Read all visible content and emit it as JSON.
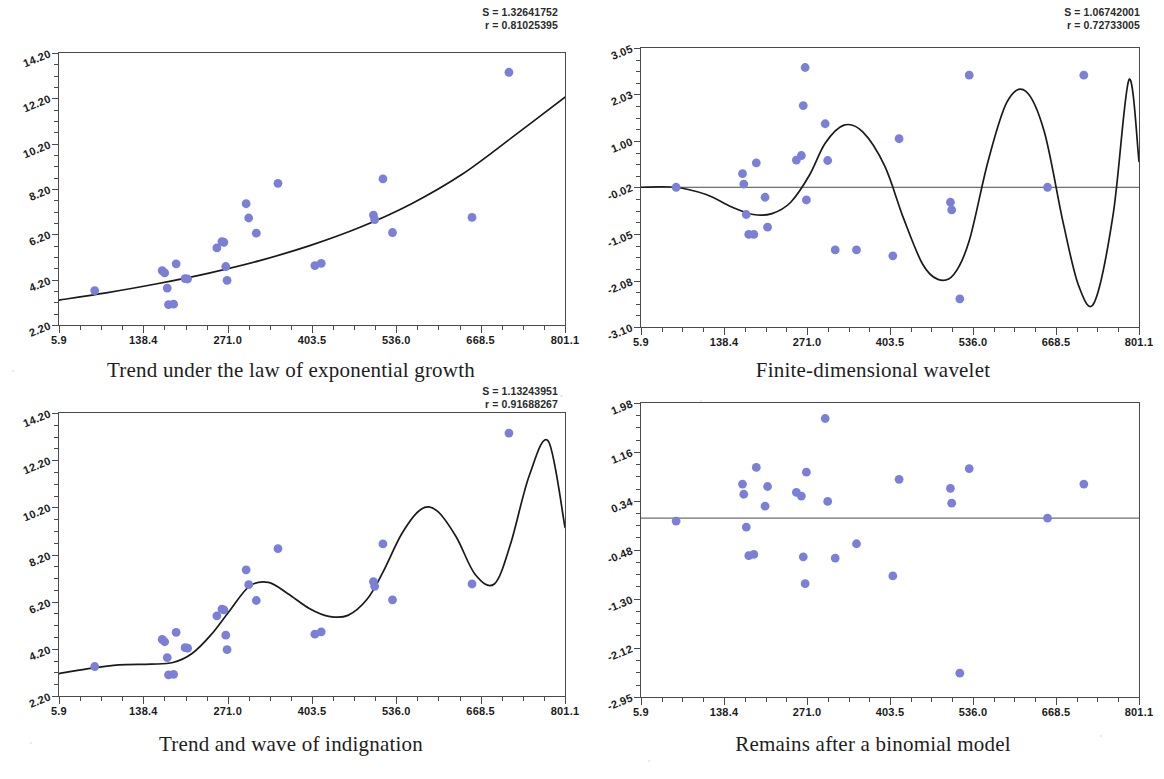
{
  "figure": {
    "marker_color": "#7b7fd8",
    "line_color": "#1a1a1a",
    "axis_color": "#4a4a4a",
    "background": "#ffffff"
  },
  "panels": [
    {
      "id": "top-left",
      "caption": "Trend under the law of exponential growth",
      "stats": {
        "s_label": "S = 1.32641752",
        "r_label": "r = 0.81025395"
      },
      "chart_data": {
        "type": "scatter",
        "title": "Trend under the law of exponential growth",
        "xlabel": "",
        "ylabel": "",
        "grid": false,
        "legend": "none",
        "xlim": [
          5.9,
          801.1
        ],
        "ylim": [
          2.2,
          14.2
        ],
        "xticks": [
          "5.9",
          "138.4",
          "271.0",
          "403.5",
          "536.0",
          "668.5",
          "801.1"
        ],
        "xtick_values": [
          5.9,
          138.4,
          271.0,
          403.5,
          536.0,
          668.5,
          801.1
        ],
        "yticks": [
          "14.20",
          "12.20",
          "10.20",
          "8.20",
          "6.20",
          "4.20",
          "2.20"
        ],
        "ytick_values": [
          14.2,
          12.2,
          10.2,
          8.2,
          6.2,
          4.2,
          2.2
        ],
        "points": [
          [
            62,
            3.72
          ],
          [
            168,
            4.6
          ],
          [
            172,
            4.5
          ],
          [
            176,
            3.83
          ],
          [
            178,
            3.1
          ],
          [
            186,
            3.12
          ],
          [
            190,
            4.9
          ],
          [
            204,
            4.25
          ],
          [
            208,
            4.23
          ],
          [
            254,
            5.6
          ],
          [
            262,
            5.88
          ],
          [
            265,
            5.85
          ],
          [
            268,
            4.78
          ],
          [
            270,
            4.17
          ],
          [
            300,
            7.55
          ],
          [
            304,
            6.92
          ],
          [
            316,
            6.25
          ],
          [
            350,
            8.45
          ],
          [
            408,
            4.82
          ],
          [
            418,
            4.92
          ],
          [
            500,
            7.05
          ],
          [
            502,
            6.85
          ],
          [
            515,
            8.65
          ],
          [
            530,
            6.28
          ],
          [
            655,
            6.95
          ],
          [
            713,
            13.35
          ]
        ],
        "series": [
          {
            "name": "exponential trend",
            "type": "line",
            "model": "exponential growth",
            "x": [
              5.9,
              80,
              160,
              240,
              320,
              400,
              480,
              560,
              640,
              720,
              801.1
            ],
            "y": [
              3.3,
              3.62,
              4.02,
              4.48,
              5.03,
              5.7,
              6.52,
              7.55,
              8.86,
              10.52,
              12.25
            ]
          }
        ]
      }
    },
    {
      "id": "top-right",
      "caption": "Finite-dimensional wavelet",
      "stats": {
        "s_label": "S = 1.06742001",
        "r_label": "r = 0.72733005"
      },
      "chart_data": {
        "type": "scatter",
        "title": "Finite-dimensional wavelet",
        "xlabel": "",
        "ylabel": "",
        "grid": false,
        "legend": "none",
        "xlim": [
          5.9,
          801.1
        ],
        "ylim": [
          -3.1,
          3.05
        ],
        "xticks": [
          "5.9",
          "138.4",
          "271.0",
          "403.5",
          "536.0",
          "668.5",
          "801.1"
        ],
        "xtick_values": [
          5.9,
          138.4,
          271.0,
          403.5,
          536.0,
          668.5,
          801.1
        ],
        "yticks": [
          "3.05",
          "2.03",
          "1.00",
          "-0.02",
          "-1.05",
          "-2.08",
          "-3.10"
        ],
        "ytick_values": [
          3.05,
          2.03,
          1.0,
          -0.02,
          -1.05,
          -2.08,
          -3.1
        ],
        "points": [
          [
            62,
            -0.02
          ],
          [
            168,
            0.28
          ],
          [
            170,
            0.05
          ],
          [
            174,
            -0.62
          ],
          [
            178,
            -1.06
          ],
          [
            186,
            -1.06
          ],
          [
            190,
            0.52
          ],
          [
            204,
            -0.24
          ],
          [
            208,
            -0.9
          ],
          [
            254,
            0.58
          ],
          [
            262,
            0.68
          ],
          [
            265,
            1.78
          ],
          [
            268,
            2.62
          ],
          [
            270,
            -0.3
          ],
          [
            300,
            1.38
          ],
          [
            304,
            0.57
          ],
          [
            316,
            -1.4
          ],
          [
            350,
            -1.4
          ],
          [
            408,
            -1.53
          ],
          [
            418,
            1.05
          ],
          [
            500,
            -0.35
          ],
          [
            502,
            -0.52
          ],
          [
            515,
            -2.48
          ],
          [
            530,
            2.45
          ],
          [
            655,
            -0.02
          ],
          [
            713,
            2.45
          ]
        ],
        "series": [
          {
            "name": "wavelet fit",
            "type": "line",
            "model": "finite-dimensional wavelet",
            "x": [
              5.9,
              60,
              110,
              150,
              185,
              215,
              245,
              275,
              300,
              330,
              360,
              395,
              425,
              455,
              480,
              505,
              530,
              560,
              590,
              620,
              650,
              680,
              705,
              730,
              760,
              785,
              801.1
            ],
            "y": [
              -0.02,
              -0.02,
              -0.18,
              -0.45,
              -0.62,
              -0.6,
              -0.35,
              0.25,
              0.95,
              1.35,
              1.2,
              0.45,
              -0.7,
              -1.7,
              -2.05,
              -1.95,
              -1.2,
              0.55,
              1.85,
              2.1,
              1.2,
              -0.8,
              -2.2,
              -2.55,
              -0.6,
              2.35,
              0.55
            ]
          }
        ]
      }
    },
    {
      "id": "bottom-left",
      "caption": "Trend and wave of indignation",
      "stats": {
        "s_label": "S = 1.13243951",
        "r_label": "r = 0.91688267"
      },
      "chart_data": {
        "type": "scatter",
        "title": "Trend and wave of indignation",
        "xlabel": "",
        "ylabel": "",
        "grid": false,
        "legend": "none",
        "xlim": [
          5.9,
          801.1
        ],
        "ylim": [
          2.2,
          14.2
        ],
        "xticks": [
          "5.9",
          "138.4",
          "271.0",
          "403.5",
          "536.0",
          "668.5",
          "801.1"
        ],
        "xtick_values": [
          5.9,
          138.4,
          271.0,
          403.5,
          536.0,
          668.5,
          801.1
        ],
        "yticks": [
          "14.20",
          "12.20",
          "10.20",
          "8.20",
          "6.20",
          "4.20",
          "2.20"
        ],
        "ytick_values": [
          14.2,
          12.2,
          10.2,
          8.2,
          6.2,
          4.2,
          2.2
        ],
        "points": [
          [
            62,
            3.45
          ],
          [
            168,
            4.6
          ],
          [
            172,
            4.5
          ],
          [
            176,
            3.83
          ],
          [
            178,
            3.1
          ],
          [
            186,
            3.12
          ],
          [
            190,
            4.9
          ],
          [
            204,
            4.25
          ],
          [
            208,
            4.23
          ],
          [
            254,
            5.6
          ],
          [
            262,
            5.88
          ],
          [
            265,
            5.85
          ],
          [
            268,
            4.78
          ],
          [
            270,
            4.17
          ],
          [
            300,
            7.55
          ],
          [
            304,
            6.92
          ],
          [
            316,
            6.25
          ],
          [
            350,
            8.45
          ],
          [
            408,
            4.82
          ],
          [
            418,
            4.92
          ],
          [
            500,
            7.05
          ],
          [
            502,
            6.85
          ],
          [
            515,
            8.65
          ],
          [
            530,
            6.28
          ],
          [
            655,
            6.95
          ],
          [
            713,
            13.35
          ]
        ],
        "series": [
          {
            "name": "trend + wave",
            "type": "line",
            "model": "trend and wave of indignation",
            "x": [
              5.9,
              50,
              100,
              150,
              185,
              215,
              245,
              275,
              305,
              335,
              365,
              400,
              430,
              460,
              490,
              515,
              545,
              575,
              600,
              630,
              660,
              690,
              715,
              745,
              775,
              801.1
            ],
            "y": [
              3.15,
              3.35,
              3.52,
              3.55,
              3.62,
              4.0,
              4.8,
              5.85,
              6.85,
              7.02,
              6.55,
              5.9,
              5.58,
              5.62,
              6.3,
              7.45,
              9.1,
              10.12,
              10.05,
              8.95,
              7.35,
              6.95,
              8.6,
              11.55,
              13.0,
              9.35
            ]
          }
        ]
      }
    },
    {
      "id": "bottom-right",
      "caption": "Remains after a binomial model",
      "stats": {
        "s_label": "",
        "r_label": ""
      },
      "chart_data": {
        "type": "scatter",
        "title": "Remains after a binomial model",
        "xlabel": "",
        "ylabel": "",
        "grid": false,
        "legend": "none",
        "xlim": [
          5.9,
          801.1
        ],
        "ylim": [
          -2.95,
          1.98
        ],
        "xticks": [
          "5.9",
          "138.4",
          "271.0",
          "403.5",
          "536.0",
          "668.5",
          "801.1"
        ],
        "xtick_values": [
          5.9,
          138.4,
          271.0,
          403.5,
          536.0,
          668.5,
          801.1
        ],
        "yticks": [
          "1.98",
          "1.16",
          "0.34",
          "-0.48",
          "-1.30",
          "-2.12",
          "-2.95"
        ],
        "ytick_values": [
          1.98,
          1.16,
          0.34,
          -0.48,
          -1.3,
          -2.12,
          -2.95
        ],
        "reference_line_y": 0.05,
        "points": [
          [
            62,
            0.0
          ],
          [
            168,
            0.62
          ],
          [
            170,
            0.45
          ],
          [
            174,
            -0.1
          ],
          [
            178,
            -0.58
          ],
          [
            186,
            -0.56
          ],
          [
            190,
            0.9
          ],
          [
            204,
            0.25
          ],
          [
            208,
            0.58
          ],
          [
            254,
            0.48
          ],
          [
            262,
            0.42
          ],
          [
            265,
            -0.6
          ],
          [
            268,
            -1.05
          ],
          [
            270,
            0.82
          ],
          [
            300,
            1.72
          ],
          [
            304,
            0.33
          ],
          [
            316,
            -0.62
          ],
          [
            350,
            -0.38
          ],
          [
            408,
            -0.92
          ],
          [
            418,
            0.7
          ],
          [
            500,
            0.55
          ],
          [
            502,
            0.3
          ],
          [
            515,
            -2.55
          ],
          [
            530,
            0.88
          ],
          [
            655,
            0.05
          ],
          [
            713,
            0.62
          ]
        ]
      }
    }
  ]
}
